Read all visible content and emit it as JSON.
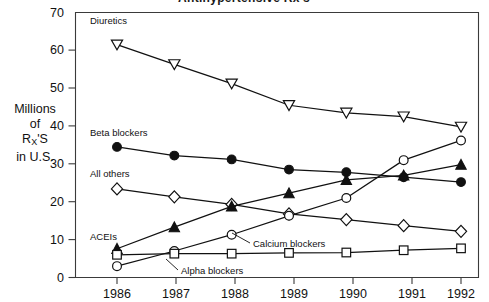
{
  "figure": {
    "title": "Antihypertensive Rx's",
    "title_clipped": true
  },
  "axis": {
    "y_label_lines": [
      "Millions",
      "of",
      "R",
      "in U.S."
    ],
    "y_label_sub": "X",
    "y_label_suffix": "'S",
    "y_ticks": [
      "0",
      "10",
      "20",
      "30",
      "40",
      "50",
      "60",
      "70"
    ],
    "x_ticks": [
      "1986",
      "1987",
      "1988",
      "1989",
      "1990",
      "1991",
      "1992"
    ]
  },
  "annotations": {
    "diuretics": "Diuretics",
    "beta_blockers": "Beta blockers",
    "all_others": "All others",
    "aceis": "ACEIs",
    "calcium_blockers": "Calcium blockers",
    "alpha_blockers": "Alpha blockers"
  },
  "chart_data": {
    "type": "line",
    "title": "Antihypertensive Rx's",
    "xlabel": "",
    "ylabel": "Millions of RX'S in U.S.",
    "x": [
      1986,
      1987,
      1988,
      1989,
      1990,
      1991,
      1992
    ],
    "categories": [
      "1986",
      "1987",
      "1988",
      "1989",
      "1990",
      "1991",
      "1992"
    ],
    "xlim": [
      1986,
      1992
    ],
    "ylim": [
      0,
      70
    ],
    "ytick_step": 10,
    "grid": false,
    "legend": "inline-annotations",
    "series": [
      {
        "name": "Diuretics",
        "marker": "triangle-down-open",
        "values": [
          61.5,
          56.3,
          51.2,
          45.5,
          43.5,
          42.5,
          39.8
        ]
      },
      {
        "name": "Beta blockers",
        "marker": "circle-solid",
        "values": [
          34.5,
          32.2,
          31.2,
          28.5,
          27.8,
          26.5,
          25.2
        ]
      },
      {
        "name": "All others",
        "marker": "diamond-open",
        "values": [
          23.4,
          21.3,
          19.3,
          16.8,
          15.3,
          13.7,
          12.2
        ]
      },
      {
        "name": "ACEIs",
        "marker": "triangle-up-solid",
        "values": [
          7.6,
          13.3,
          18.8,
          22.3,
          25.8,
          27.0,
          29.8
        ]
      },
      {
        "name": "Calcium blockers",
        "marker": "circle-open",
        "values": [
          3.0,
          7.0,
          11.3,
          16.3,
          21.0,
          31.0,
          36.2
        ]
      },
      {
        "name": "Alpha blockers",
        "marker": "square-open",
        "values": [
          6.0,
          6.3,
          6.3,
          6.5,
          6.6,
          7.2,
          7.7
        ]
      }
    ]
  }
}
